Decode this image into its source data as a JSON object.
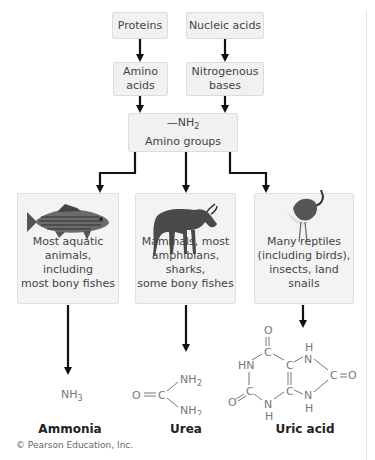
{
  "sources": {
    "proteins": "Proteins",
    "nucleic_acids": "Nucleic acids"
  },
  "intermediates": {
    "amino_acids": [
      "Amino",
      "acids"
    ],
    "nitrogenous_bases": [
      "Nitrogenous",
      "bases"
    ]
  },
  "amino_group": {
    "formula": "—NH",
    "formula_sub": "2",
    "label": "Amino groups"
  },
  "organisms": [
    {
      "icon": "fish-icon",
      "lines": [
        "Most aquatic",
        "animals, including",
        "most bony fishes"
      ]
    },
    {
      "icon": "wildebeest-icon",
      "lines": [
        "Mammals, most",
        "amphibians, sharks,",
        "some bony fishes"
      ]
    },
    {
      "icon": "bird-icon",
      "lines": [
        "Many reptiles",
        "(including birds),",
        "insects, land snails"
      ]
    }
  ],
  "products": [
    {
      "name": "Ammonia",
      "formula": "NH",
      "formula_sub": "3"
    },
    {
      "name": "Urea",
      "formula": "O=C(NH2)2"
    },
    {
      "name": "Uric acid",
      "formula": "C5H4N4O3"
    }
  ],
  "urea_struct": {
    "o": "O",
    "c": "C",
    "nh": "NH",
    "sub": "2"
  },
  "uric_struct": {
    "o": "O",
    "c": "C",
    "n": "N",
    "h": "H",
    "hn": "HN"
  },
  "credit": "© Pearson Education, Inc."
}
